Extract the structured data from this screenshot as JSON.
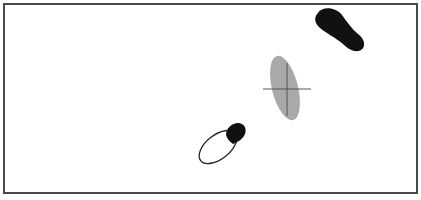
{
  "diagram": {
    "type": "footprint-gait-diagram",
    "frame": {
      "border_color": "#4a4a4a",
      "background": "#ffffff"
    },
    "elements": [
      {
        "id": "filled-footprint",
        "label": "",
        "style": "solid-black",
        "color": "#111111",
        "position": "upper-right"
      },
      {
        "id": "center-ellipse",
        "label": "",
        "style": "gray-filled-ellipse",
        "color": "#9a9a9a",
        "position": "center-right"
      },
      {
        "id": "crosshair",
        "label": "",
        "style": "thin-lines",
        "color": "#555555",
        "position": "on-ellipse"
      },
      {
        "id": "outlined-footprint",
        "label": "",
        "style": "outline-with-black-toe",
        "color": "#222222",
        "position": "lower-middle"
      }
    ]
  }
}
